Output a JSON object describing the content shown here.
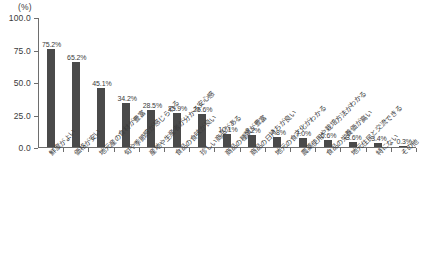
{
  "chart_data": {
    "type": "bar",
    "title": "",
    "subtitle": "",
    "xlabel": "",
    "ylabel": "",
    "unit_label": "(%)",
    "ylim": [
      0.0,
      100.0
    ],
    "yticks": [
      "0.0",
      "25.0",
      "50.0",
      "75.0",
      "100.0"
    ],
    "ytick_values": [
      0.0,
      25.0,
      50.0,
      75.0,
      100.0
    ],
    "grid": false,
    "legend": null,
    "bar_color": "#4a4a4a",
    "axis_color": "#6e6e6e",
    "categories": [
      "鮮度がよい",
      "価格が安い",
      "地元産の食材が豊富",
      "旬や季節感が感じられる",
      "産地や生産者が分かる安心感",
      "食品の食味が良い",
      "珍しい商品がある",
      "商品の種類が豊富",
      "商品の日持ちが良い",
      "地元の食文化がわかる",
      "農薬使用や栽培方法がわかる",
      "食品の栄養価が高い",
      "地元住民と交流できる",
      "特にない",
      "その他"
    ],
    "values": [
      75.2,
      65.2,
      45.1,
      34.2,
      28.5,
      25.9,
      25.6,
      10.1,
      9.2,
      7.8,
      7.0,
      5.6,
      3.6,
      3.4,
      0.3
    ],
    "value_labels": [
      "75.2%",
      "65.2%",
      "45.1%",
      "34.2%",
      "28.5%",
      "25.9%",
      "25.6%",
      "10.1%",
      "9.2%",
      "7.8%",
      "7.0%",
      "5.6%",
      "3.6%",
      "3.4%",
      "0.3%"
    ]
  }
}
